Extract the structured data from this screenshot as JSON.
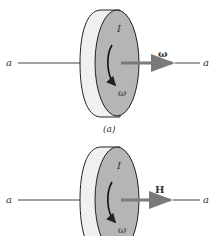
{
  "figure_a": {
    "axis_left_label": "a",
    "axis_right_label": "a",
    "inertia_label": "I",
    "rotation_label": "ω",
    "vector_label": "ω",
    "caption": "(a)"
  },
  "figure_b": {
    "axis_left_label": "a",
    "axis_right_label": "a",
    "inertia_label": "I",
    "rotation_label": "ω",
    "vector_label": "H"
  },
  "colors": {
    "face": "#b5b5b5",
    "rim": "#f0f0f0",
    "arrow": "#7a7a7a",
    "line": "#444444"
  }
}
